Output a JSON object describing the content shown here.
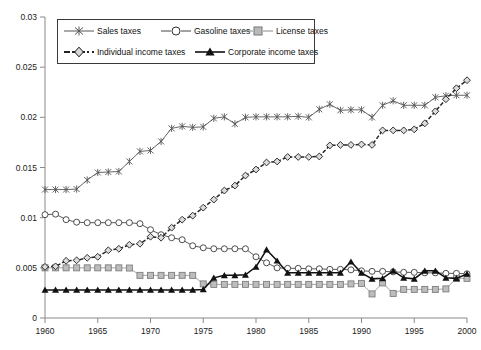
{
  "chart_data": {
    "type": "line",
    "title": "",
    "xlabel": "",
    "ylabel": "",
    "xlim": [
      1960,
      2000
    ],
    "ylim": [
      0,
      0.03
    ],
    "grid": false,
    "legend_position": "top-center",
    "xticks": [
      "1960",
      "1965",
      "1970",
      "1975",
      "1980",
      "1985",
      "1990",
      "1995",
      "2000"
    ],
    "yticks": [
      "0",
      "0.005",
      "0.01",
      "0.015",
      "0.02",
      "0.025",
      "0.03"
    ],
    "x": [
      1960,
      1961,
      1962,
      1963,
      1964,
      1965,
      1966,
      1967,
      1968,
      1969,
      1970,
      1971,
      1972,
      1973,
      1974,
      1975,
      1976,
      1977,
      1978,
      1979,
      1980,
      1981,
      1982,
      1983,
      1984,
      1985,
      1986,
      1987,
      1988,
      1989,
      1990,
      1991,
      1992,
      1993,
      1994,
      1995,
      1996,
      1997,
      1998,
      1999,
      2000
    ],
    "series": [
      {
        "name": "Sales taxes",
        "marker": "asterisk",
        "color": "#555555",
        "values": [
          0.0128,
          0.0128,
          0.0128,
          0.01285,
          0.01375,
          0.0145,
          0.01455,
          0.0146,
          0.0156,
          0.0166,
          0.0167,
          0.0176,
          0.0189,
          0.0191,
          0.019,
          0.01905,
          0.0199,
          0.02005,
          0.01935,
          0.02,
          0.02005,
          0.02005,
          0.02005,
          0.02005,
          0.0201,
          0.02,
          0.0208,
          0.0213,
          0.0207,
          0.02075,
          0.02075,
          0.02,
          0.0212,
          0.02165,
          0.0212,
          0.0212,
          0.0212,
          0.022,
          0.02215,
          0.0222,
          0.0222
        ]
      },
      {
        "name": "Gasoline taxes",
        "marker": "circle",
        "color": "#444444",
        "values": [
          0.0103,
          0.01035,
          0.0098,
          0.00955,
          0.0095,
          0.0095,
          0.0095,
          0.0095,
          0.0095,
          0.0094,
          0.0088,
          0.0083,
          0.008,
          0.0078,
          0.0072,
          0.007,
          0.0069,
          0.0069,
          0.0069,
          0.0069,
          0.0061,
          0.0055,
          0.005,
          0.00495,
          0.00495,
          0.0049,
          0.0049,
          0.00485,
          0.00485,
          0.0048,
          0.0047,
          0.00465,
          0.00465,
          0.0046,
          0.00455,
          0.00455,
          0.0045,
          0.0045,
          0.00445,
          0.00445,
          0.0044
        ]
      },
      {
        "name": "License taxes",
        "marker": "square",
        "color": "#9b9b9b",
        "values": [
          0.005,
          0.005,
          0.005,
          0.005,
          0.005,
          0.005,
          0.005,
          0.005,
          0.00498,
          0.00425,
          0.00425,
          0.00425,
          0.00425,
          0.00425,
          0.00425,
          0.0034,
          0.00335,
          0.00335,
          0.00335,
          0.00335,
          0.00335,
          0.00335,
          0.00335,
          0.00335,
          0.00335,
          0.00335,
          0.00335,
          0.00335,
          0.00335,
          0.0034,
          0.00345,
          0.0024,
          0.0035,
          0.00245,
          0.00285,
          0.00285,
          0.00285,
          0.00285,
          0.0029,
          0.00395,
          0.00395
        ]
      },
      {
        "name": "Individual income taxes",
        "marker": "diamond",
        "color": "#262626",
        "values": [
          0.0051,
          0.00515,
          0.0057,
          0.00575,
          0.006,
          0.0061,
          0.00675,
          0.0069,
          0.0073,
          0.0074,
          0.0081,
          0.008,
          0.009,
          0.0098,
          0.0102,
          0.011,
          0.0118,
          0.0127,
          0.0132,
          0.0142,
          0.0148,
          0.0155,
          0.0156,
          0.01605,
          0.01605,
          0.01605,
          0.0161,
          0.0172,
          0.01725,
          0.01725,
          0.0173,
          0.01725,
          0.0187,
          0.0187,
          0.0187,
          0.0188,
          0.0194,
          0.0206,
          0.0218,
          0.0229,
          0.0237
        ]
      },
      {
        "name": "Corporate income taxes",
        "marker": "triangle",
        "color": "#111111",
        "values": [
          0.0028,
          0.0028,
          0.0028,
          0.0028,
          0.0028,
          0.0028,
          0.0028,
          0.0028,
          0.0028,
          0.0028,
          0.0028,
          0.0028,
          0.0028,
          0.0028,
          0.0028,
          0.00285,
          0.004,
          0.00425,
          0.00425,
          0.0043,
          0.0051,
          0.0068,
          0.0057,
          0.0045,
          0.0045,
          0.0045,
          0.0045,
          0.0045,
          0.0045,
          0.0056,
          0.0045,
          0.0039,
          0.00395,
          0.0047,
          0.004,
          0.0039,
          0.0047,
          0.0047,
          0.004,
          0.00395,
          0.0044
        ]
      }
    ]
  },
  "legend": {
    "items": [
      {
        "label": "Sales taxes"
      },
      {
        "label": "Gasoline taxes"
      },
      {
        "label": "License taxes"
      },
      {
        "label": "Individual income taxes"
      },
      {
        "label": "Corporate income taxes"
      }
    ]
  }
}
